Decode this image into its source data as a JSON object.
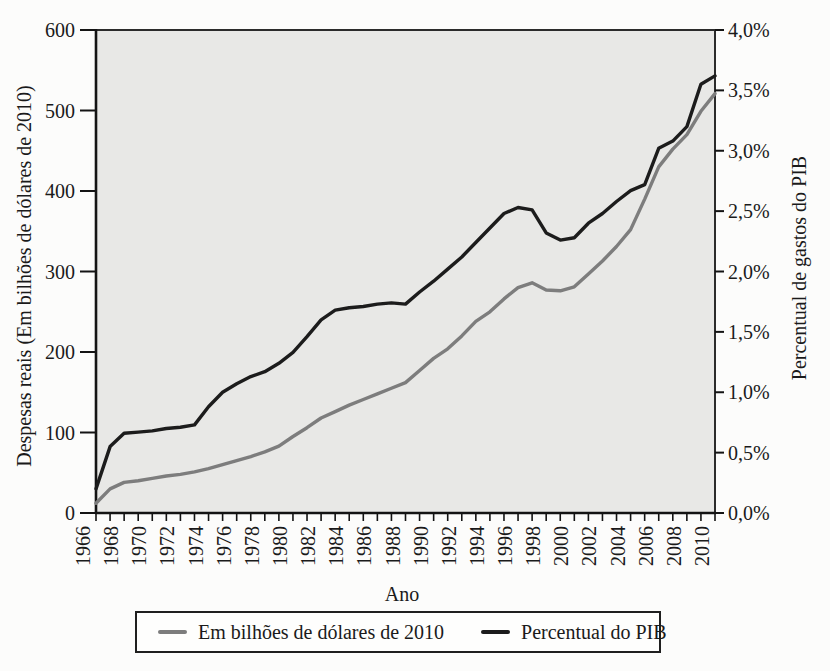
{
  "figure": {
    "x_axis_label": "Ano",
    "left_axis_label": "Despesas reais (Em bilhões de dólares de 2010)",
    "right_axis_label": "Percentual de gastos do PIB",
    "legend": {
      "items": [
        {
          "label": "Em bilhões de dólares de 2010",
          "color": "#7d7d7d"
        },
        {
          "label": "Percentual do PIB",
          "color": "#1c1c1c"
        }
      ]
    },
    "colors": {
      "plot_background": "#e8e8e6",
      "frame": "#2b2b2b",
      "axis": "#141414",
      "text": "#1a1a1a",
      "series_dollars": "#7d7d7d",
      "series_pib": "#1c1c1c"
    }
  },
  "chart_data": {
    "type": "line",
    "title": "",
    "xlabel": "Ano",
    "x": [
      1966,
      1967,
      1968,
      1969,
      1970,
      1971,
      1972,
      1973,
      1974,
      1975,
      1976,
      1977,
      1978,
      1979,
      1980,
      1981,
      1982,
      1983,
      1984,
      1985,
      1986,
      1987,
      1988,
      1989,
      1990,
      1991,
      1992,
      1993,
      1994,
      1995,
      1996,
      1997,
      1998,
      1999,
      2000,
      2001,
      2002,
      2003,
      2004,
      2005,
      2006,
      2007,
      2008,
      2009,
      2010
    ],
    "series": [
      {
        "name": "Em bilhões de dólares de 2010",
        "axis": "left",
        "color": "#7d7d7d",
        "values": [
          12,
          30,
          38,
          40,
          43,
          46,
          48,
          51,
          55,
          60,
          65,
          70,
          76,
          83,
          95,
          106,
          118,
          126,
          134,
          141,
          148,
          155,
          162,
          177,
          192,
          204,
          220,
          238,
          250,
          266,
          280,
          286,
          277,
          276,
          281,
          297,
          313,
          331,
          352,
          390,
          430,
          452,
          470,
          499,
          521
        ]
      },
      {
        "name": "Percentual do PIB",
        "axis": "right",
        "color": "#1c1c1c",
        "values": [
          0.2,
          0.55,
          0.66,
          0.67,
          0.68,
          0.7,
          0.71,
          0.73,
          0.88,
          1.0,
          1.07,
          1.13,
          1.17,
          1.24,
          1.33,
          1.46,
          1.6,
          1.68,
          1.7,
          1.71,
          1.73,
          1.74,
          1.73,
          1.83,
          1.92,
          2.02,
          2.12,
          2.24,
          2.36,
          2.48,
          2.53,
          2.51,
          2.32,
          2.26,
          2.28,
          2.4,
          2.48,
          2.58,
          2.67,
          2.72,
          3.02,
          3.08,
          3.2,
          3.55,
          3.62
        ]
      }
    ],
    "left_axis": {
      "label": "Despesas reais (Em bilhões de dólares de 2010)",
      "min": 0,
      "max": 600,
      "tick_values": [
        0,
        100,
        200,
        300,
        400,
        500,
        600
      ],
      "tick_labels": [
        "0",
        "100",
        "200",
        "300",
        "400",
        "500",
        "600"
      ]
    },
    "right_axis": {
      "label": "Percentual de gastos do PIB",
      "min": 0,
      "max": 4,
      "tick_values": [
        0,
        0.5,
        1,
        1.5,
        2,
        2.5,
        3,
        3.5,
        4
      ],
      "tick_labels": [
        "0,0%",
        "0,5%",
        "1,0%",
        "1,5%",
        "2,0%",
        "2,5%",
        "3,0%",
        "3,5%",
        "4,0%"
      ]
    },
    "x_axis": {
      "label": "Ano",
      "min": 1966,
      "max": 2010,
      "tick_every": 1,
      "label_every": 2
    },
    "legend_position": "bottom",
    "grid": false
  }
}
